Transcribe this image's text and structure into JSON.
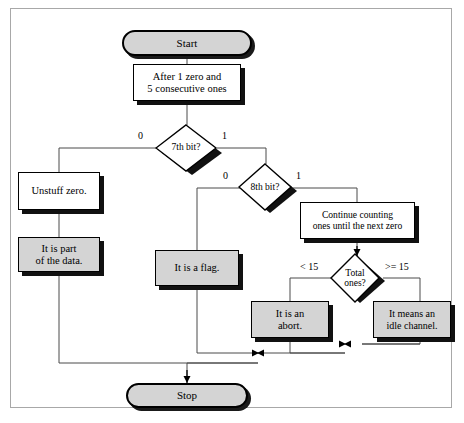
{
  "diagram": {
    "type": "flowchart",
    "colors": {
      "fill_gray": "#d4d4d4",
      "fill_white": "#ffffff",
      "stroke": "#000000",
      "shadow": "#111111",
      "frame_border": "#a8a8a8",
      "background": "#ffffff"
    },
    "nodes": {
      "start": {
        "label": "Start",
        "shape": "terminal",
        "fill": "gray"
      },
      "after_zero": {
        "line1": "After 1 zero and",
        "line2": "5 consecutive ones",
        "shape": "process",
        "fill": "white"
      },
      "seventh_bit": {
        "label_line1": "7th bit?",
        "shape": "decision",
        "fill": "white"
      },
      "eighth_bit": {
        "label_line1": "8th bit?",
        "shape": "decision",
        "fill": "white"
      },
      "unstuff_zero": {
        "line1": "Unstuff zero.",
        "shape": "process",
        "fill": "white"
      },
      "part_of_data": {
        "line1": "It is part",
        "line2": "of the data.",
        "shape": "process",
        "fill": "gray"
      },
      "is_a_flag": {
        "line1": "It is a flag.",
        "shape": "process",
        "fill": "gray"
      },
      "continue_counting": {
        "line1": "Continue counting",
        "line2": "ones until the next zero",
        "shape": "process",
        "fill": "white"
      },
      "total_ones": {
        "label_line1": "Total",
        "label_line2": "ones?",
        "shape": "decision",
        "fill": "white"
      },
      "is_an_abort": {
        "line1": "It is an",
        "line2": "abort.",
        "shape": "process",
        "fill": "gray"
      },
      "idle_channel": {
        "line1": "It means an",
        "line2": "idle channel.",
        "shape": "process",
        "fill": "gray"
      },
      "stop": {
        "label": "Stop",
        "shape": "terminal",
        "fill": "gray"
      }
    },
    "edge_labels": {
      "seventh_zero": "0",
      "seventh_one": "1",
      "eighth_zero": "0",
      "eighth_one": "1",
      "total_lt15": "< 15",
      "total_ge15": ">= 15"
    }
  }
}
